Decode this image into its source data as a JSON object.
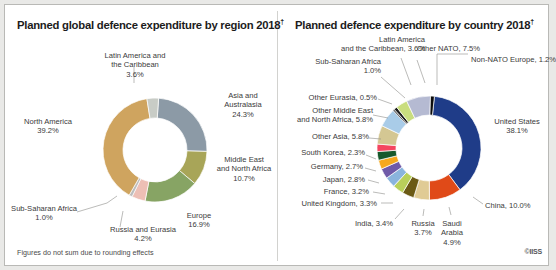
{
  "figure": {
    "footnote": "Figures do not sum due to rounding effects",
    "credit": "©IISS",
    "footnote_marker": "†"
  },
  "chart_data": [
    {
      "type": "pie",
      "id": "by-region",
      "title": "Planned global defence expenditure by region 2018",
      "title_marker": "†",
      "donut": true,
      "total": 100,
      "categories": [
        "Asia and Australasia",
        "Middle East and North Africa",
        "Europe",
        "Russia and Eurasia",
        "Sub-Saharan Africa",
        "North America",
        "Latin America and the Caribbean"
      ],
      "values": [
        24.3,
        10.7,
        16.9,
        4.2,
        1.0,
        39.2,
        3.6
      ],
      "colors": [
        "#8c9aa6",
        "#a8a558",
        "#87a464",
        "#edbfb5",
        "#bdbdbd",
        "#cfa45f",
        "#c8ccc6"
      ],
      "labels": [
        {
          "name": "Asia and Australasia",
          "value": "24.3%",
          "line1": "Asia and",
          "line2": "Australasia",
          "line3": "24.3%"
        },
        {
          "name": "Middle East and North Africa",
          "value": "10.7%",
          "line1": "Middle East",
          "line2": "and North Africa",
          "line3": "10.7%"
        },
        {
          "name": "Europe",
          "value": "16.9%",
          "line1": "Europe",
          "line2": "16.9%"
        },
        {
          "name": "Russia and Eurasia",
          "value": "4.2%",
          "line1": "Russia and Eurasia",
          "line2": "4.2%"
        },
        {
          "name": "Sub-Saharan Africa",
          "value": "1.0%",
          "line1": "Sub-Saharan Africa",
          "line2": "1.0%"
        },
        {
          "name": "North America",
          "value": "39.2%",
          "line1": "North America",
          "line2": "39.2%"
        },
        {
          "name": "Latin America and the Caribbean",
          "value": "3.6%",
          "line1": "Latin America and",
          "line2": "the Caribbean",
          "line3": "3.6%"
        }
      ]
    },
    {
      "type": "pie",
      "id": "by-country",
      "title": "Planned defence expenditure by country 2018",
      "title_marker": "†",
      "donut": true,
      "total": 100,
      "categories": [
        "United States",
        "China",
        "Saudi Arabia",
        "Russia",
        "India",
        "United Kingdom",
        "France",
        "Japan",
        "Germany",
        "South Korea",
        "Other Asia",
        "Other Middle East and North Africa",
        "Other Eurasia",
        "Sub-Saharan Africa",
        "Latin America and the Caribbean",
        "Other NATO",
        "Non-NATO Europe"
      ],
      "values": [
        38.1,
        10.0,
        4.9,
        3.7,
        3.4,
        3.3,
        3.2,
        2.8,
        2.7,
        2.3,
        5.8,
        5.8,
        0.5,
        1.0,
        3.6,
        7.5,
        1.2
      ],
      "colors": [
        "#1f3c88",
        "#e04a18",
        "#e0cb95",
        "#6b5a15",
        "#b9d05a",
        "#8ab4dd",
        "#6f5aa8",
        "#f5a81e",
        "#17592c",
        "#f4455f",
        "#d4c793",
        "#a9cce8",
        "#3a3a3a",
        "#1d1d1d",
        "#c9dd7f",
        "#b5bad2",
        "#0c0c0c"
      ],
      "labels": [
        {
          "name": "United States",
          "line1": "United States",
          "line2": "38.1%"
        },
        {
          "name": "China",
          "line1": "China, 10.0%"
        },
        {
          "name": "Saudi Arabia",
          "line1": "Saudi",
          "line2": "Arabia",
          "line3": "4.9%"
        },
        {
          "name": "Russia",
          "line1": "Russia",
          "line2": "3.7%"
        },
        {
          "name": "India",
          "line1": "India, 3.4%"
        },
        {
          "name": "United Kingdom",
          "line1": "United Kingdom, 3.3%"
        },
        {
          "name": "France",
          "line1": "France, 3.2%"
        },
        {
          "name": "Japan",
          "line1": "Japan, 2.8%"
        },
        {
          "name": "Germany",
          "line1": "Germany, 2.7%"
        },
        {
          "name": "South Korea",
          "line1": "South Korea, 2.3%"
        },
        {
          "name": "Other Asia",
          "line1": "Other Asia, 5.8%"
        },
        {
          "name": "Other Middle East and North Africa",
          "line1": "Other Middle East",
          "line2": "and North Africa, 5.8%"
        },
        {
          "name": "Other Eurasia",
          "line1": "Other Eurasia, 0.5%"
        },
        {
          "name": "Sub-Saharan Africa",
          "line1": "Sub-Saharan Africa",
          "line2": "1.0%"
        },
        {
          "name": "Latin America and the Caribbean",
          "line1": "Latin America",
          "line2": "and the Caribbean, 3.6%"
        },
        {
          "name": "Other NATO",
          "line1": "Other NATO, 7.5%"
        },
        {
          "name": "Non-NATO Europe",
          "line1": "Non-NATO Europe, 1.2%"
        }
      ]
    }
  ]
}
